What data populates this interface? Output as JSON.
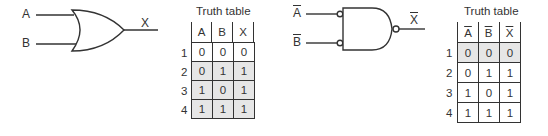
{
  "or_gate": {
    "inputs": [
      "A",
      "B"
    ],
    "output": "X"
  },
  "nand_gate": {
    "inputs": [
      "A",
      "B"
    ],
    "inputs_inverted": true,
    "output": "X",
    "output_inverted": true
  },
  "left_table": {
    "title": "Truth table",
    "headers": [
      "A",
      "B",
      "X"
    ],
    "headers_overlined": false,
    "row_numbers": [
      "1",
      "2",
      "3",
      "4"
    ],
    "rows": [
      [
        "0",
        "0",
        "0"
      ],
      [
        "0",
        "1",
        "1"
      ],
      [
        "1",
        "0",
        "1"
      ],
      [
        "1",
        "1",
        "1"
      ]
    ],
    "shaded_rows": [
      1,
      2,
      3
    ]
  },
  "right_table": {
    "title": "Truth table",
    "headers": [
      "A",
      "B",
      "X"
    ],
    "headers_overlined": true,
    "row_numbers": [
      "1",
      "2",
      "3",
      "4"
    ],
    "rows": [
      [
        "0",
        "0",
        "0"
      ],
      [
        "0",
        "1",
        "1"
      ],
      [
        "1",
        "0",
        "1"
      ],
      [
        "1",
        "1",
        "1"
      ]
    ],
    "shaded_rows": [
      0
    ]
  },
  "colors": {
    "line": "#333333",
    "shade": "#e6e6e6"
  }
}
